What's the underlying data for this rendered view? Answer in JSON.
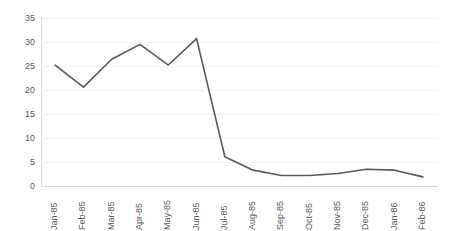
{
  "chart_data": {
    "type": "line",
    "title": "",
    "subtitle": "",
    "xlabel": "",
    "ylabel": "",
    "categories": [
      "Jan-85",
      "Feb-85",
      "Mar-85",
      "Apr-85",
      "May-85",
      "Jun-85",
      "Jul-85",
      "Aug-85",
      "Sep-85",
      "Oct-85",
      "Nov-85",
      "Dec-85",
      "Jan-86",
      "Feb-86"
    ],
    "values": [
      25.2,
      20.6,
      26.4,
      29.5,
      25.2,
      30.7,
      6.1,
      3.3,
      2.2,
      2.2,
      2.6,
      3.5,
      3.3,
      1.9
    ],
    "series": [
      {
        "name": "",
        "values": [
          25.2,
          20.6,
          26.4,
          29.5,
          25.2,
          30.7,
          6.1,
          3.3,
          2.2,
          2.2,
          2.6,
          3.5,
          3.3,
          1.9
        ]
      }
    ],
    "ylim": [
      0,
      35
    ],
    "yticks": [
      0,
      5,
      10,
      15,
      20,
      25,
      30,
      35
    ],
    "ytick_labels": [
      "0",
      "5",
      "10",
      "15",
      "20",
      "25",
      "30",
      "35"
    ],
    "grid": true,
    "grid_axis": "y",
    "legend": false,
    "legend_position": "none",
    "xtick_rotation": 90,
    "markers": false,
    "colors": {
      "line": "#595959",
      "gridline": "#f2f2f2",
      "axis": "#d9d9d9",
      "tick_label": "#595959",
      "background": "#ffffff"
    },
    "line_width": 1.6
  }
}
